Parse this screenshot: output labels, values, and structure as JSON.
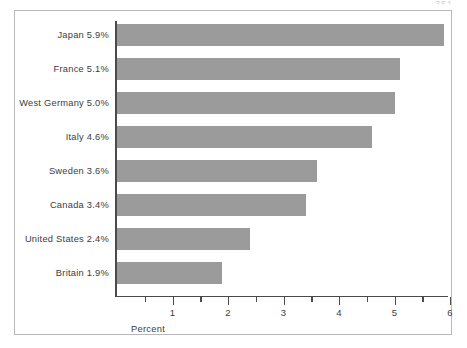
{
  "page": {
    "number_artifact": "351"
  },
  "chart_data": {
    "type": "bar",
    "orientation": "horizontal",
    "title": "",
    "xlabel": "Percent",
    "ylabel": "",
    "xlim": [
      0,
      6
    ],
    "grid": false,
    "legend": null,
    "bar_color": "#9b9b9b",
    "axis_color": "#4a4a4a",
    "frame_color": "#b9b9b9",
    "background": "#ffffff",
    "categories": [
      "Japan",
      "France",
      "West Germany",
      "Italy",
      "Sweden",
      "Canada",
      "United States",
      "Britain"
    ],
    "values": [
      5.9,
      5.1,
      5.0,
      4.6,
      3.6,
      3.4,
      2.4,
      1.9
    ],
    "labels": [
      "Japan 5.9%",
      "France 5.1%",
      "West Germany 5.0%",
      "Italy 4.6%",
      "Sweden 3.6%",
      "Canada 3.4%",
      "United States  2.4%",
      "Britain  1.9%"
    ],
    "xticks": [
      1,
      2,
      3,
      4,
      5,
      6
    ],
    "xticklabels": [
      "1",
      "2",
      "3",
      "4",
      "5",
      "6"
    ],
    "xminorticks": [
      0.5,
      1.5,
      2.5,
      3.5,
      4.5,
      5.5
    ]
  }
}
